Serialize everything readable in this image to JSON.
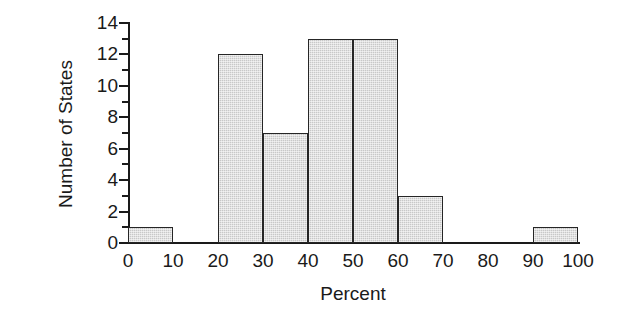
{
  "chart_data": {
    "type": "bar",
    "title": "",
    "xlabel": "Percent",
    "ylabel": "Number of States",
    "xlim": [
      0,
      100
    ],
    "ylim": [
      0,
      14
    ],
    "grid": false,
    "legend": null,
    "bin_width": 10,
    "bin_edges": [
      0,
      10,
      20,
      30,
      40,
      50,
      60,
      70,
      80,
      90,
      100
    ],
    "categories": [
      "0-10",
      "10-20",
      "20-30",
      "30-40",
      "40-50",
      "50-60",
      "60-70",
      "70-80",
      "80-90",
      "90-100"
    ],
    "values": [
      1,
      0,
      12,
      7,
      13,
      13,
      3,
      0,
      0,
      1
    ],
    "bars": [
      {
        "bin": "0-10",
        "start": 0,
        "end": 10,
        "value": 1
      },
      {
        "bin": "10-20",
        "start": 10,
        "end": 20,
        "value": 0
      },
      {
        "bin": "20-30",
        "start": 20,
        "end": 30,
        "value": 12
      },
      {
        "bin": "30-40",
        "start": 30,
        "end": 40,
        "value": 7
      },
      {
        "bin": "40-50",
        "start": 40,
        "end": 50,
        "value": 13
      },
      {
        "bin": "50-60",
        "start": 50,
        "end": 60,
        "value": 13
      },
      {
        "bin": "60-70",
        "start": 60,
        "end": 70,
        "value": 3
      },
      {
        "bin": "70-80",
        "start": 70,
        "end": 80,
        "value": 0
      },
      {
        "bin": "80-90",
        "start": 80,
        "end": 90,
        "value": 0
      },
      {
        "bin": "90-100",
        "start": 90,
        "end": 100,
        "value": 1
      }
    ],
    "x_ticks": [
      0,
      10,
      20,
      30,
      40,
      50,
      60,
      70,
      80,
      90,
      100
    ],
    "x_tick_labels": [
      "0",
      "10",
      "20",
      "30",
      "40",
      "50",
      "60",
      "70",
      "80",
      "90",
      "100"
    ],
    "y_ticks_major": [
      0,
      2,
      4,
      6,
      8,
      10,
      12,
      14
    ],
    "y_tick_labels": [
      "0",
      "2",
      "4",
      "6",
      "8",
      "10",
      "12",
      "14"
    ],
    "y_ticks_minor": [
      1,
      3,
      5,
      7,
      9,
      11,
      13
    ],
    "colors": {
      "bar_fill": "#c8c8c8",
      "bar_edge": "#262626",
      "axis": "#1a1a1a",
      "background": "#ffffff",
      "text": "#1a1a1a"
    }
  }
}
